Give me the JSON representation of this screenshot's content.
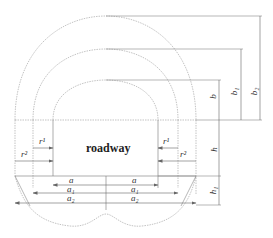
{
  "diagram": {
    "title": "roadway",
    "colors": {
      "line": "#888888",
      "text": "#333333",
      "background": "#ffffff"
    },
    "labels": {
      "b": "b",
      "b1": "b₁",
      "b2": "b₂",
      "h": "h",
      "h1": "h₁",
      "r1_left": "r¹",
      "r2_left": "r²",
      "r1_right": "r¹",
      "r2_right": "r²",
      "a_left": "a",
      "a_right": "a",
      "a1_left": "a₁",
      "a1_right": "a₁",
      "a2_left": "a₂",
      "a2_right": "a₂"
    },
    "zones": [
      "inner contour (roadway)",
      "middle contour",
      "outer contour"
    ]
  }
}
